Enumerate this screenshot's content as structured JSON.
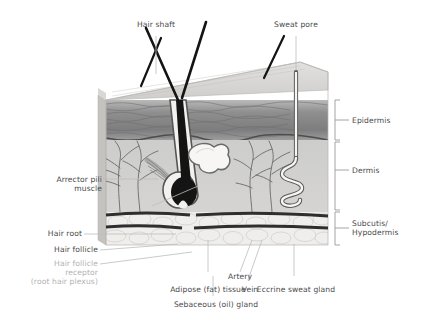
{
  "diagram": {
    "title_visible": false,
    "colors": {
      "label_text": "#4a4a4a",
      "muted_text": "#b2b2b2",
      "leader_line": "#b9b9b9",
      "bracket": "#9a9a9a",
      "surface_top": "#d8d8d6",
      "epidermis_band": "#8d8d8d",
      "dermis": "#c9c9c9",
      "subcutis": "#eceaea",
      "hair": "#1a1a1a",
      "vessel": "#555555"
    }
  },
  "labels": {
    "hair_shaft": "Hair shaft",
    "sweat_pore": "Sweat pore",
    "epidermis": "Epidermis",
    "dermis": "Dermis",
    "subcutis_l1": "Subcutis/",
    "subcutis_l2": "Hypodermis",
    "arrector_l1": "Arrector pili",
    "arrector_l2": "muscle",
    "hair_root": "Hair root",
    "hair_follicle": "Hair follicle",
    "receptor_l1": "Hair follicle",
    "receptor_l2": "receptor",
    "receptor_l3": "(root hair plexus)",
    "adipose": "Adipose (fat) tissue",
    "artery": "Artery",
    "vein": "Vein",
    "eccrine": "Eccrine sweat gland",
    "sebaceous": "Sebaceous (oil) gland"
  },
  "structures": [
    {
      "name": "hair-shaft",
      "region": "above-surface"
    },
    {
      "name": "sweat-pore",
      "region": "epidermis-surface"
    },
    {
      "name": "epidermis",
      "region": "layer-1"
    },
    {
      "name": "dermis",
      "region": "layer-2"
    },
    {
      "name": "subcutis-hypodermis",
      "region": "layer-3"
    },
    {
      "name": "arrector-pili-muscle",
      "region": "dermis"
    },
    {
      "name": "hair-root",
      "region": "dermis"
    },
    {
      "name": "hair-follicle",
      "region": "dermis"
    },
    {
      "name": "hair-follicle-receptor",
      "region": "subcutis"
    },
    {
      "name": "adipose-tissue",
      "region": "subcutis"
    },
    {
      "name": "artery",
      "region": "subcutis"
    },
    {
      "name": "vein",
      "region": "subcutis"
    },
    {
      "name": "eccrine-sweat-gland",
      "region": "dermis"
    },
    {
      "name": "sebaceous-gland",
      "region": "dermis"
    }
  ]
}
